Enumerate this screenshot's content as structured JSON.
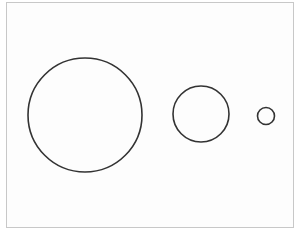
{
  "diagram": {
    "frame": {
      "border_color": "#c8c8c8",
      "background": "#fdfdfd"
    },
    "stroke_color": "#333333",
    "stroke_width": 1.6,
    "circles": [
      {
        "label": "large-circle",
        "cx": 85,
        "cy": 115,
        "r": 57
      },
      {
        "label": "medium-circle",
        "cx": 201,
        "cy": 114,
        "r": 28
      },
      {
        "label": "small-circle",
        "cx": 266,
        "cy": 116,
        "r": 8.5
      }
    ]
  }
}
